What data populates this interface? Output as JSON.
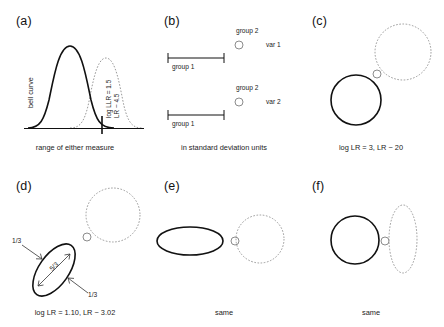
{
  "figure": {
    "panels": [
      {
        "id": "a",
        "label": "(a)",
        "caption": "range of either measure",
        "ylabel": "bell curve",
        "annotation_line1": "log LLR = 1.5",
        "annotation_line2": "LR ~ 4.5",
        "curves": [
          {
            "name": "group-1-distribution",
            "style": "solid",
            "peak_x": 0.36
          },
          {
            "name": "group-2-distribution",
            "style": "dotted",
            "peak_x": 0.66
          }
        ],
        "marker_x": 0.62
      },
      {
        "id": "b",
        "label": "(b)",
        "caption": "in standard deviation units",
        "rows": [
          {
            "var_label": "var 1",
            "group1_label": "group 1",
            "group2_label": "group 2"
          },
          {
            "var_label": "var 2",
            "group1_label": "group 1",
            "group2_label": "group 2"
          }
        ]
      },
      {
        "id": "c",
        "label": "(c)",
        "caption": "log LR = 3, LR ~ 20",
        "shapes": [
          {
            "name": "group2-dotted-circle",
            "style": "dotted",
            "kind": "circle"
          },
          {
            "name": "group2-point-circle",
            "style": "small",
            "kind": "circle"
          },
          {
            "name": "group1-solid-circle",
            "style": "solid",
            "kind": "circle"
          }
        ]
      },
      {
        "id": "d",
        "label": "(d)",
        "caption": "log LR = 1.10, LR ~ 3.02",
        "arrow_labels": [
          "1/3",
          "1/3"
        ],
        "inner_label": "5/3",
        "shapes": [
          {
            "name": "group2-dotted-circle",
            "style": "dotted",
            "kind": "circle"
          },
          {
            "name": "group2-point-circle",
            "style": "small",
            "kind": "circle"
          },
          {
            "name": "group1-tilted-ellipse",
            "style": "solid",
            "kind": "ellipse",
            "rotation_deg": -55
          }
        ]
      },
      {
        "id": "e",
        "label": "(e)",
        "caption": "same",
        "shapes": [
          {
            "name": "group1-wide-ellipse",
            "style": "solid",
            "kind": "ellipse"
          },
          {
            "name": "group2-point-circle",
            "style": "small",
            "kind": "circle"
          },
          {
            "name": "group2-dotted-circle",
            "style": "dotted",
            "kind": "circle"
          }
        ]
      },
      {
        "id": "f",
        "label": "(f)",
        "caption": "same",
        "shapes": [
          {
            "name": "group1-solid-circle",
            "style": "solid",
            "kind": "circle"
          },
          {
            "name": "group2-point-circle",
            "style": "small",
            "kind": "circle"
          },
          {
            "name": "group2-tall-dotted-ellipse",
            "style": "dotted",
            "kind": "ellipse"
          }
        ]
      }
    ],
    "colors": {
      "solid": "#111111",
      "dotted": "#9a9a9a",
      "text": "#222222",
      "background": "#ffffff"
    }
  }
}
